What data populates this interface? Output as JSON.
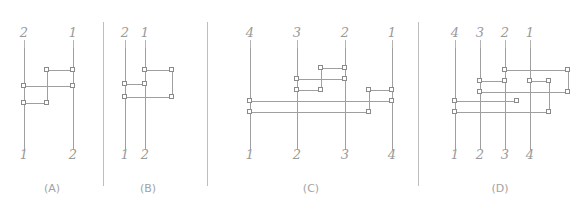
{
  "figure": {
    "title": "",
    "panels": [
      {
        "id": "A",
        "caption": "(A)",
        "caption_x": 52,
        "top_labels": [
          {
            "text": "2",
            "x": 24
          },
          {
            "text": "1",
            "x": 73
          }
        ],
        "bottom_labels": [
          {
            "text": "1",
            "x": 24
          },
          {
            "text": "2",
            "x": 73
          }
        ],
        "wires": [
          {
            "x": 24,
            "y1": 48,
            "y2": 150
          },
          {
            "x": 73,
            "y1": 48,
            "y2": 150
          },
          {
            "x": 47,
            "y1": 70,
            "y2": 103
          }
        ],
        "rungs": [
          {
            "y": 70,
            "x1": 47,
            "x2": 73
          },
          {
            "y": 86,
            "x1": 24,
            "x2": 73
          },
          {
            "y": 103,
            "x1": 24,
            "x2": 47
          }
        ],
        "nodes": [
          {
            "x": 47,
            "y": 70
          },
          {
            "x": 73,
            "y": 70
          },
          {
            "x": 24,
            "y": 86
          },
          {
            "x": 73,
            "y": 86
          },
          {
            "x": 24,
            "y": 103
          },
          {
            "x": 47,
            "y": 103
          }
        ],
        "stubs": [
          {
            "x": 24,
            "y1": 40,
            "y2": 50
          },
          {
            "x": 73,
            "y1": 40,
            "y2": 50
          },
          {
            "x": 24,
            "y1": 125,
            "y2": 140
          },
          {
            "x": 73,
            "y1": 125,
            "y2": 140
          }
        ]
      },
      {
        "id": "B",
        "caption": "(B)",
        "caption_x": 148,
        "top_labels": [
          {
            "text": "2",
            "x": 125
          },
          {
            "text": "1",
            "x": 145
          }
        ],
        "bottom_labels": [
          {
            "text": "1",
            "x": 125
          },
          {
            "text": "2",
            "x": 145
          }
        ],
        "wires": [
          {
            "x": 125,
            "y1": 48,
            "y2": 150
          },
          {
            "x": 145,
            "y1": 48,
            "y2": 150
          },
          {
            "x": 172,
            "y1": 70,
            "y2": 97
          }
        ],
        "rungs": [
          {
            "y": 70,
            "x1": 145,
            "x2": 172
          },
          {
            "y": 84,
            "x1": 125,
            "x2": 145
          },
          {
            "y": 97,
            "x1": 125,
            "x2": 172
          }
        ],
        "nodes": [
          {
            "x": 145,
            "y": 70
          },
          {
            "x": 172,
            "y": 70
          },
          {
            "x": 125,
            "y": 84
          },
          {
            "x": 145,
            "y": 84
          },
          {
            "x": 125,
            "y": 97
          },
          {
            "x": 172,
            "y": 97
          }
        ],
        "stubs": [
          {
            "x": 125,
            "y1": 40,
            "y2": 50
          },
          {
            "x": 145,
            "y1": 40,
            "y2": 50
          },
          {
            "x": 125,
            "y1": 125,
            "y2": 140
          },
          {
            "x": 145,
            "y1": 125,
            "y2": 140
          }
        ]
      },
      {
        "id": "C",
        "caption": "(C)",
        "caption_x": 311,
        "top_labels": [
          {
            "text": "4",
            "x": 250
          },
          {
            "text": "3",
            "x": 297
          },
          {
            "text": "2",
            "x": 345
          },
          {
            "text": "1",
            "x": 392
          }
        ],
        "bottom_labels": [
          {
            "text": "1",
            "x": 250
          },
          {
            "text": "2",
            "x": 297
          },
          {
            "text": "3",
            "x": 345
          },
          {
            "text": "4",
            "x": 392
          }
        ],
        "wires": [
          {
            "x": 250,
            "y1": 48,
            "y2": 150
          },
          {
            "x": 297,
            "y1": 48,
            "y2": 150
          },
          {
            "x": 345,
            "y1": 48,
            "y2": 150
          },
          {
            "x": 392,
            "y1": 48,
            "y2": 150
          },
          {
            "x": 321,
            "y1": 68,
            "y2": 90
          },
          {
            "x": 369,
            "y1": 90,
            "y2": 112
          }
        ],
        "rungs": [
          {
            "y": 68,
            "x1": 321,
            "x2": 345
          },
          {
            "y": 79,
            "x1": 297,
            "x2": 345
          },
          {
            "y": 90,
            "x1": 297,
            "x2": 321
          },
          {
            "y": 90,
            "x1": 369,
            "x2": 392
          },
          {
            "y": 101,
            "x1": 250,
            "x2": 392
          },
          {
            "y": 112,
            "x1": 250,
            "x2": 369
          }
        ],
        "nodes": [
          {
            "x": 321,
            "y": 68
          },
          {
            "x": 345,
            "y": 68
          },
          {
            "x": 297,
            "y": 79
          },
          {
            "x": 345,
            "y": 79
          },
          {
            "x": 297,
            "y": 90
          },
          {
            "x": 321,
            "y": 90
          },
          {
            "x": 369,
            "y": 90
          },
          {
            "x": 392,
            "y": 90
          },
          {
            "x": 250,
            "y": 101
          },
          {
            "x": 392,
            "y": 101
          },
          {
            "x": 250,
            "y": 112
          },
          {
            "x": 369,
            "y": 112
          }
        ],
        "stubs": [
          {
            "x": 250,
            "y1": 40,
            "y2": 50
          },
          {
            "x": 297,
            "y1": 40,
            "y2": 50
          },
          {
            "x": 345,
            "y1": 40,
            "y2": 50
          },
          {
            "x": 392,
            "y1": 40,
            "y2": 50
          },
          {
            "x": 250,
            "y1": 128,
            "y2": 142
          },
          {
            "x": 297,
            "y1": 128,
            "y2": 142
          },
          {
            "x": 345,
            "y1": 128,
            "y2": 142
          },
          {
            "x": 392,
            "y1": 128,
            "y2": 142
          }
        ]
      },
      {
        "id": "D",
        "caption": "(D)",
        "caption_x": 500,
        "top_labels": [
          {
            "text": "4",
            "x": 455
          },
          {
            "text": "3",
            "x": 480
          },
          {
            "text": "2",
            "x": 505
          },
          {
            "text": "1",
            "x": 530
          }
        ],
        "bottom_labels": [
          {
            "text": "1",
            "x": 455
          },
          {
            "text": "2",
            "x": 480
          },
          {
            "text": "3",
            "x": 505
          },
          {
            "text": "4",
            "x": 530
          }
        ],
        "wires": [
          {
            "x": 455,
            "y1": 48,
            "y2": 150
          },
          {
            "x": 480,
            "y1": 48,
            "y2": 150
          },
          {
            "x": 505,
            "y1": 48,
            "y2": 150
          },
          {
            "x": 530,
            "y1": 48,
            "y2": 150
          },
          {
            "x": 568,
            "y1": 70,
            "y2": 92
          },
          {
            "x": 549,
            "y1": 81,
            "y2": 112
          }
        ],
        "rungs": [
          {
            "y": 70,
            "x1": 505,
            "x2": 568
          },
          {
            "y": 81,
            "x1": 480,
            "x2": 505
          },
          {
            "y": 81,
            "x1": 530,
            "x2": 549
          },
          {
            "y": 92,
            "x1": 480,
            "x2": 568
          },
          {
            "y": 101,
            "x1": 455,
            "x2": 517
          },
          {
            "y": 112,
            "x1": 455,
            "x2": 549
          }
        ],
        "nodes": [
          {
            "x": 505,
            "y": 70
          },
          {
            "x": 568,
            "y": 70
          },
          {
            "x": 480,
            "y": 81
          },
          {
            "x": 505,
            "y": 81
          },
          {
            "x": 530,
            "y": 81
          },
          {
            "x": 549,
            "y": 81
          },
          {
            "x": 480,
            "y": 92
          },
          {
            "x": 568,
            "y": 92
          },
          {
            "x": 455,
            "y": 101
          },
          {
            "x": 517,
            "y": 101
          },
          {
            "x": 455,
            "y": 112
          },
          {
            "x": 549,
            "y": 112
          }
        ],
        "stubs": [
          {
            "x": 455,
            "y1": 40,
            "y2": 50
          },
          {
            "x": 480,
            "y1": 40,
            "y2": 50
          },
          {
            "x": 505,
            "y1": 40,
            "y2": 50
          },
          {
            "x": 530,
            "y1": 40,
            "y2": 50
          },
          {
            "x": 455,
            "y1": 128,
            "y2": 142
          },
          {
            "x": 480,
            "y1": 128,
            "y2": 142
          },
          {
            "x": 505,
            "y1": 128,
            "y2": 142
          },
          {
            "x": 530,
            "y1": 128,
            "y2": 142
          }
        ]
      }
    ],
    "dividers": [
      {
        "x": 103,
        "y1": 22,
        "y2": 186
      },
      {
        "x": 207,
        "y1": 22,
        "y2": 186
      },
      {
        "x": 418,
        "y1": 22,
        "y2": 186
      }
    ],
    "label_rows": {
      "top_y": 26,
      "bottom_y": 148,
      "caption_y": 182
    },
    "colors": {
      "wire": "#9f9f9f",
      "node_border": "#8a8a8a",
      "node_fill": "#ffffff",
      "label": "#9a9a9a",
      "divider": "#bdbdbd",
      "background": "#ffffff"
    }
  }
}
